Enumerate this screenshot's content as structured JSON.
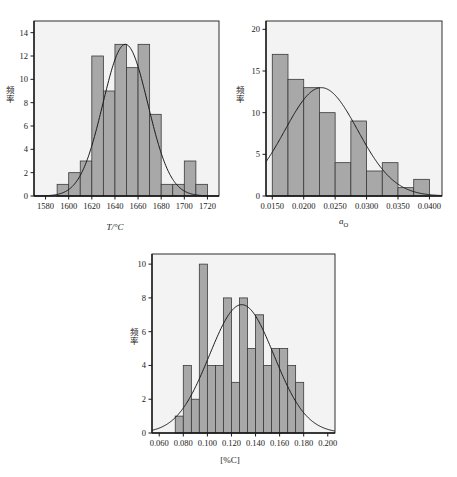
{
  "figure": {
    "background": "#ffffff",
    "bar_fill": "#a8a8a8",
    "bar_stroke": "#3a3a3a",
    "curve_color": "#1a1a1a",
    "axis_color": "#1a1a1a",
    "panel_fill": "#f3f3f3"
  },
  "chart_data": [
    {
      "id": "panel-temperature",
      "type": "bar",
      "title": "",
      "xlabel": "T/°C",
      "ylabel": "频率",
      "xlim": [
        1570,
        1730
      ],
      "ylim": [
        0,
        15
      ],
      "yticks": [
        0,
        2,
        4,
        6,
        8,
        10,
        12,
        14
      ],
      "ytick_labels": [
        "0",
        "2",
        "4",
        "6",
        "8",
        "10",
        "12",
        "14"
      ],
      "xticks": [
        1580,
        1600,
        1620,
        1640,
        1660,
        1680,
        1700,
        1720
      ],
      "xtick_labels": [
        "1580",
        "1600",
        "1620",
        "1640",
        "1660",
        "1680",
        "1700",
        "1720"
      ],
      "bin_width": 10,
      "bin_edges": [
        1590,
        1600,
        1610,
        1620,
        1630,
        1640,
        1650,
        1660,
        1670,
        1680,
        1690,
        1700,
        1710,
        1720
      ],
      "values": [
        1,
        2,
        3,
        12,
        9,
        13,
        11,
        13,
        7,
        1,
        1,
        3,
        1
      ],
      "curve": {
        "type": "gaussian",
        "amplitude": 13.0,
        "mean": 1649,
        "sigma": 19.5
      },
      "grid": false,
      "legend": null
    },
    {
      "id": "panel-oxygen-activity",
      "type": "bar",
      "title": "",
      "xlabel": "a_O",
      "xlabel_base": "a",
      "xlabel_sub": "O",
      "ylabel": "频率",
      "xlim": [
        0.014,
        0.042
      ],
      "ylim": [
        0,
        21
      ],
      "yticks": [
        0,
        5,
        10,
        15,
        20
      ],
      "ytick_labels": [
        "0",
        "5",
        "10",
        "15",
        "20"
      ],
      "xticks": [
        0.015,
        0.02,
        0.025,
        0.03,
        0.035,
        0.04
      ],
      "xtick_labels": [
        "0.0150",
        "0.0200",
        "0.0250",
        "0.0300",
        "0.0350",
        "0.0400"
      ],
      "bin_width": 0.0025,
      "bin_edges": [
        0.015,
        0.0175,
        0.02,
        0.0225,
        0.025,
        0.0275,
        0.03,
        0.0325,
        0.035,
        0.0375,
        0.04
      ],
      "values": [
        17,
        14,
        13,
        10,
        4,
        9,
        3,
        4,
        1,
        2
      ],
      "curve": {
        "type": "gaussian",
        "amplitude": 13.0,
        "mean": 0.0228,
        "sigma": 0.0058
      },
      "grid": false,
      "legend": null
    },
    {
      "id": "panel-carbon",
      "type": "bar",
      "title": "",
      "xlabel": "[%C]",
      "ylabel": "频率",
      "xlim": [
        0.054,
        0.206
      ],
      "ylim": [
        0,
        10.6
      ],
      "yticks": [
        0,
        2,
        4,
        6,
        8,
        10
      ],
      "ytick_labels": [
        "0",
        "2",
        "4",
        "6",
        "8",
        "10"
      ],
      "xticks": [
        0.06,
        0.08,
        0.1,
        0.12,
        0.14,
        0.16,
        0.18,
        0.2
      ],
      "xtick_labels": [
        "0.060",
        "0.080",
        "0.100",
        "0.120",
        "0.140",
        "0.160",
        "0.180",
        "0.200"
      ],
      "bin_width": 0.00667,
      "bin_edges": [
        0.0733,
        0.08,
        0.0867,
        0.0933,
        0.1,
        0.1067,
        0.1133,
        0.12,
        0.1267,
        0.1333,
        0.14,
        0.1467,
        0.1533,
        0.16,
        0.1667,
        0.1733,
        0.18
      ],
      "values": [
        1,
        4,
        2,
        10,
        4,
        4,
        8,
        3,
        8,
        5,
        7,
        4,
        5,
        5,
        4,
        3
      ],
      "curve": {
        "type": "gaussian",
        "amplitude": 7.6,
        "mean": 0.1285,
        "sigma": 0.0268
      },
      "grid": false,
      "legend": null
    }
  ]
}
